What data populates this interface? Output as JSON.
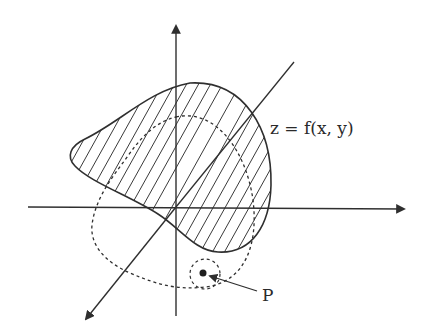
{
  "diagram": {
    "title": "",
    "labels": {
      "surface": "z = f(x, y)",
      "point": "P"
    },
    "colors": {
      "ink": "#2f2f2f",
      "background": "#ffffff"
    },
    "elements": [
      {
        "type": "axis",
        "name": "vertical-axis",
        "direction": "up"
      },
      {
        "type": "axis",
        "name": "horizontal-axis",
        "direction": "right"
      },
      {
        "type": "axis",
        "name": "depth-axis",
        "direction": "down-left"
      },
      {
        "type": "region",
        "name": "shaded-surface-region",
        "fill": "hatched",
        "border": "solid"
      },
      {
        "type": "curve",
        "name": "projected-domain",
        "style": "dashed"
      },
      {
        "type": "neighborhood",
        "name": "point-neighborhood",
        "style": "dashed"
      },
      {
        "type": "point",
        "name": "point-P"
      }
    ]
  }
}
